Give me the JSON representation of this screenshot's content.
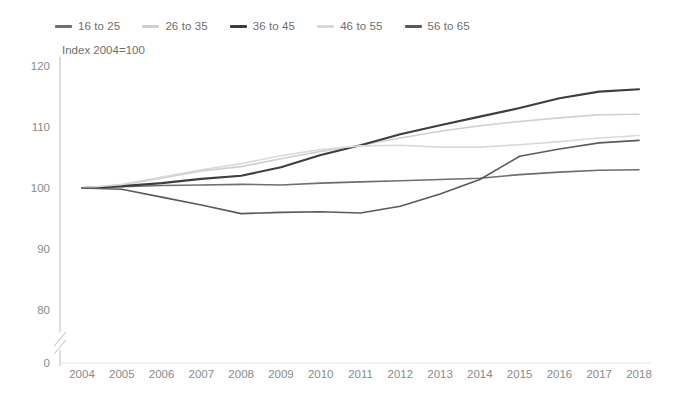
{
  "chart_data": {
    "type": "line",
    "title": "",
    "subtitle": "Index 2004=100",
    "xlabel": "",
    "ylabel": "",
    "grid": false,
    "legend_position": "top-left",
    "axis_break": true,
    "x": [
      2004,
      2005,
      2006,
      2007,
      2008,
      2009,
      2010,
      2011,
      2012,
      2013,
      2014,
      2015,
      2016,
      2017,
      2018
    ],
    "xticklabels": [
      "2004",
      "2005",
      "2006",
      "2007",
      "2008",
      "2009",
      "2010",
      "2011",
      "2012",
      "2013",
      "2014",
      "2015",
      "2016",
      "2017",
      "2018"
    ],
    "yticklabels": [
      "0",
      "80",
      "90",
      "100",
      "110",
      "120"
    ],
    "ytickvalues": [
      0,
      80,
      90,
      100,
      110,
      120
    ],
    "ylim": [
      80,
      120
    ],
    "series": [
      {
        "name": "16 to 25",
        "color": "#6e6e6e",
        "width": 1.6,
        "values": [
          100.0,
          100.2,
          100.4,
          100.5,
          100.6,
          100.5,
          100.8,
          101.0,
          101.2,
          101.4,
          101.6,
          102.2,
          102.6,
          102.9,
          103.0
        ]
      },
      {
        "name": "26 to 35",
        "color": "#cfcfcf",
        "width": 1.6,
        "values": [
          100.0,
          100.5,
          101.6,
          102.8,
          103.5,
          104.8,
          106.0,
          107.0,
          108.2,
          109.3,
          110.2,
          110.9,
          111.5,
          112.0,
          112.1
        ]
      },
      {
        "name": "36 to 45",
        "color": "#3d3d3d",
        "width": 2.1,
        "values": [
          100.0,
          100.3,
          100.8,
          101.5,
          102.0,
          103.4,
          105.4,
          107.0,
          108.8,
          110.3,
          111.7,
          113.1,
          114.7,
          115.8,
          116.2
        ]
      },
      {
        "name": "46 to 55",
        "color": "#d9d9d9",
        "width": 1.6,
        "values": [
          100.0,
          100.6,
          101.8,
          103.0,
          104.0,
          105.3,
          106.3,
          106.9,
          107.0,
          106.7,
          106.7,
          107.1,
          107.6,
          108.2,
          108.6
        ]
      },
      {
        "name": "56 to 65",
        "color": "#5a5a5a",
        "width": 1.6,
        "values": [
          100.0,
          99.8,
          98.5,
          97.2,
          95.8,
          96.0,
          96.1,
          95.9,
          97.0,
          99.0,
          101.4,
          105.2,
          106.4,
          107.4,
          107.8
        ]
      }
    ]
  }
}
